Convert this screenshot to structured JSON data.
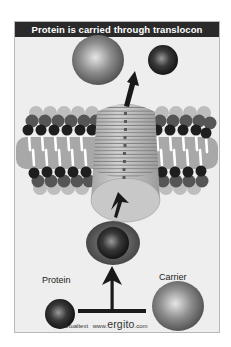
{
  "title": "Protein is carried through translocon",
  "labels": {
    "protein": "Protein",
    "carrier": "Carrier"
  },
  "footer": {
    "copyright": "©virtualtext",
    "site_prefix": "www.",
    "site_name": "ergito",
    "site_suffix": ".com"
  },
  "elements": {
    "membrane": "lipid-bilayer",
    "channel": "translocon",
    "protein_sphere": "protein",
    "carrier_sphere": "carrier",
    "complex": "carrier-protein-complex"
  },
  "colors": {
    "title_bg": "#2a2a2a",
    "panel_bg": "#eeeeee",
    "membrane": "#a8a8a8",
    "lipid_head": "#1e1e1e",
    "channel": "#c4c4c4",
    "arrow": "#1a1a1a"
  }
}
